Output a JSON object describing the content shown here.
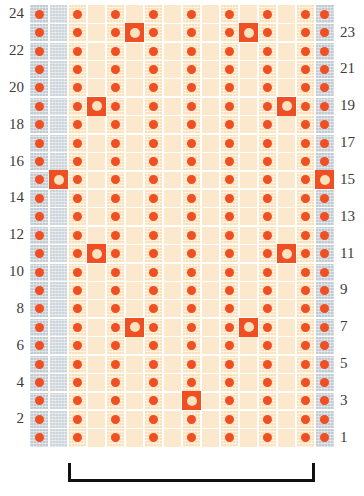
{
  "chart_data": {
    "type": "heatmap",
    "title": "",
    "xlabel": "",
    "ylabel": "",
    "columns": 16,
    "rows": 24,
    "row_labels_left": [
      "24",
      "22",
      "20",
      "18",
      "16",
      "14",
      "12",
      "10",
      "8",
      "6",
      "4",
      "2"
    ],
    "row_labels_right": [
      "23",
      "21",
      "19",
      "17",
      "15",
      "13",
      "11",
      "9",
      "7",
      "5",
      "3",
      "1"
    ],
    "legend_symbols": [
      {
        "name": "dot",
        "label": "bead / single stitch",
        "color": "#f04e23"
      },
      {
        "name": "open-circle",
        "label": "increase / eyelet",
        "color": "#f04e23"
      }
    ],
    "colors": {
      "cell_cream": "#fbe0b8",
      "cell_cream_alt": "#fce9cd",
      "cell_grey": "#c3cbd2",
      "symbol": "#f04e23",
      "gridline": "#ffffff",
      "bracket": "#111111",
      "label_text": "#3b3b3b"
    },
    "column_kinds": [
      "grey",
      "grey",
      "cream",
      "cream",
      "cream",
      "cream",
      "cream",
      "cream",
      "cream",
      "cream",
      "cream",
      "cream",
      "cream",
      "cream",
      "cream",
      "grey"
    ],
    "dot_columns": [
      0,
      2,
      4,
      6,
      8,
      10,
      12,
      14,
      15
    ],
    "open_circle_cells": [
      {
        "row": 23,
        "col": 5
      },
      {
        "row": 23,
        "col": 11
      },
      {
        "row": 19,
        "col": 3
      },
      {
        "row": 19,
        "col": 13
      },
      {
        "row": 15,
        "col": 1
      },
      {
        "row": 15,
        "col": 15
      },
      {
        "row": 11,
        "col": 3
      },
      {
        "row": 11,
        "col": 13
      },
      {
        "row": 7,
        "col": 5
      },
      {
        "row": 7,
        "col": 11
      },
      {
        "row": 3,
        "col": 8
      }
    ],
    "repeat_bracket": {
      "label": "",
      "start_col": 2,
      "end_col": 14
    }
  }
}
